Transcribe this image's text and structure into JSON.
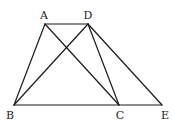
{
  "diagram": {
    "type": "geometry",
    "points": {
      "A": {
        "label": "A",
        "x": 45,
        "y": 24,
        "lx": 44,
        "ly": 19
      },
      "D": {
        "label": "D",
        "x": 88,
        "y": 24,
        "lx": 88,
        "ly": 19
      },
      "B": {
        "label": "B",
        "x": 14,
        "y": 105,
        "lx": 10,
        "ly": 119
      },
      "C": {
        "label": "C",
        "x": 119,
        "y": 105,
        "lx": 120,
        "ly": 119
      },
      "E": {
        "label": "E",
        "x": 162,
        "y": 105,
        "lx": 165,
        "ly": 119
      }
    },
    "segments": [
      "AD",
      "AB",
      "AC",
      "DB",
      "DC",
      "DE",
      "BE"
    ]
  }
}
